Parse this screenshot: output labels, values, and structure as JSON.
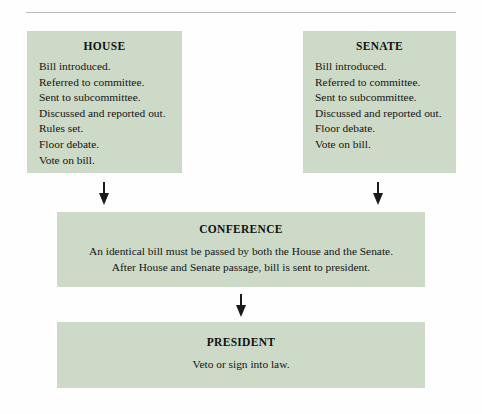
{
  "diagram": {
    "title_rule": "horizontal-rule",
    "accent_box_color": "#ccdac7",
    "text_color": "#141414",
    "rule_color": "#b9bcb8"
  },
  "chambers": [
    {
      "id": "house",
      "title": "HOUSE",
      "steps": [
        "Bill introduced.",
        "Referred to committee.",
        "Sent to subcommittee.",
        "Discussed and reported out.",
        "Rules set.",
        "Floor debate.",
        "Vote on bill."
      ]
    },
    {
      "id": "senate",
      "title": "SENATE",
      "steps": [
        "Bill introduced.",
        "Referred to committee.",
        "Sent to subcommittee.",
        "Discussed and reported out.",
        "Floor debate.",
        "Vote on bill."
      ]
    }
  ],
  "conference": {
    "title": "CONFERENCE",
    "lines": [
      "An identical bill must be passed by both the House and the Senate.",
      "After House and Senate passage, bill is sent to president."
    ]
  },
  "president": {
    "title": "PRESIDENT",
    "lines": [
      "Veto or sign into law."
    ]
  },
  "arrows": [
    {
      "id": "house-to-conference",
      "direction": "down"
    },
    {
      "id": "senate-to-conference",
      "direction": "down"
    },
    {
      "id": "conference-to-president",
      "direction": "down"
    }
  ]
}
